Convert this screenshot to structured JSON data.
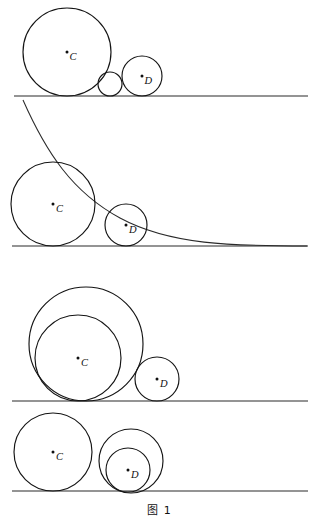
{
  "figure": {
    "caption": "图 1",
    "caption_x": 160,
    "caption_y": 508,
    "width": 319,
    "height": 530,
    "background": "#ffffff",
    "stroke_color": "#141414",
    "line_color": "#2a2a2a"
  },
  "labels": {
    "c": "C",
    "d": "D"
  },
  "panels": [
    {
      "name": "panel-1",
      "baseline": {
        "x1": 14,
        "y": 96,
        "x2": 308
      },
      "circles": [
        {
          "name": "circle-c",
          "cx": 67,
          "cy": 52,
          "r": 44,
          "label": "C",
          "label_dx": 2.5,
          "label_dy": 7.5
        },
        {
          "name": "circle-small-tangent",
          "cx": 110,
          "cy": 84,
          "r": 12,
          "label": "",
          "label_dx": 0,
          "label_dy": 0
        },
        {
          "name": "circle-d",
          "cx": 142,
          "cy": 76,
          "r": 20,
          "label": "D",
          "label_dx": 2.5,
          "label_dy": 7.5
        }
      ],
      "curve": null
    },
    {
      "name": "panel-2",
      "baseline": {
        "x1": 12,
        "y": 246,
        "x2": 308
      },
      "circles": [
        {
          "name": "circle-c",
          "cx": 53,
          "cy": 204,
          "r": 42,
          "label": "C",
          "label_dx": 3,
          "label_dy": 7.5
        },
        {
          "name": "circle-d",
          "cx": 126,
          "cy": 225,
          "r": 21,
          "label": "D",
          "label_dx": 3,
          "label_dy": 7.5
        }
      ],
      "curve": {
        "name": "tangent-curve",
        "d": "M 23,100 C 46,152 72,192 120,218 C 170,245 232,246 307,246"
      }
    },
    {
      "name": "panel-3",
      "baseline": {
        "x1": 12,
        "y": 401,
        "x2": 308
      },
      "circles": [
        {
          "name": "circle-outer",
          "cx": 86,
          "cy": 344,
          "r": 57,
          "label": "",
          "label_dx": 0,
          "label_dy": 0
        },
        {
          "name": "circle-c",
          "cx": 78,
          "cy": 358,
          "r": 43,
          "label": "C",
          "label_dx": 3,
          "label_dy": 7.5
        },
        {
          "name": "circle-d",
          "cx": 157,
          "cy": 379,
          "r": 22,
          "label": "D",
          "label_dx": 3,
          "label_dy": 7.5
        }
      ],
      "curve": null
    },
    {
      "name": "panel-4",
      "baseline": {
        "x1": 12,
        "y": 491,
        "x2": 308
      },
      "circles": [
        {
          "name": "circle-c",
          "cx": 53,
          "cy": 452,
          "r": 39,
          "label": "C",
          "label_dx": 3,
          "label_dy": 7.5
        },
        {
          "name": "circle-d-outer",
          "cx": 131,
          "cy": 461,
          "r": 32,
          "label": "",
          "label_dx": 0,
          "label_dy": 0
        },
        {
          "name": "circle-d",
          "cx": 128,
          "cy": 470,
          "r": 22,
          "label": "D",
          "label_dx": 3,
          "label_dy": 7.5
        }
      ],
      "curve": null
    }
  ]
}
